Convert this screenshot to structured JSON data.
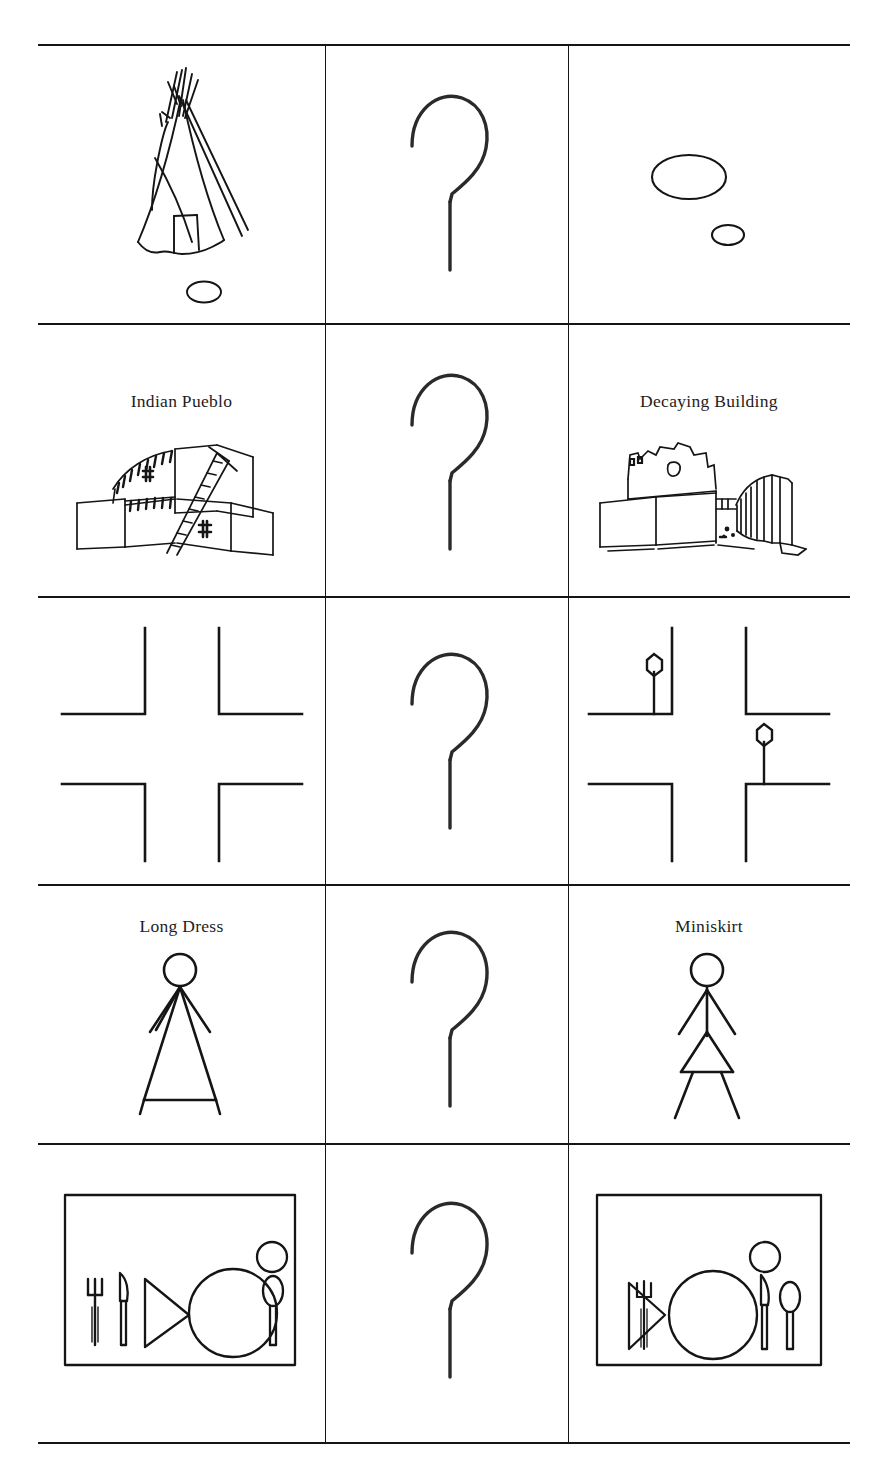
{
  "figure": {
    "type": "pictorial-comparison-grid",
    "background_color": "#ffffff",
    "ink_color": "#151515",
    "columns": 3,
    "rows": 5,
    "middle_column_content": "hand-drawn question mark (no dot)",
    "rules": {
      "horizontal_y": [
        44,
        323,
        596,
        884,
        1143,
        1442
      ],
      "vertical_x": [
        325,
        568
      ],
      "left_x": 38,
      "right_x": 850
    }
  },
  "rows": [
    {
      "id": "row-teepee",
      "left": {
        "label": "",
        "art_name": "teepee-drawing",
        "description": "teepee with small oval below"
      },
      "middle": {
        "label": "",
        "art_name": "question-mark-icon"
      },
      "right": {
        "label": "",
        "art_name": "two-ovals-drawing",
        "description": "large ellipse with small ellipse below right"
      }
    },
    {
      "id": "row-pueblo",
      "left": {
        "label": "Indian Pueblo",
        "art_name": "pueblo-building-drawing",
        "description": "adobe pueblo with ladder"
      },
      "middle": {
        "label": "",
        "art_name": "question-mark-icon"
      },
      "right": {
        "label": "Decaying Building",
        "art_name": "decaying-building-drawing",
        "description": "crumbling adobe structure with ribbed section"
      }
    },
    {
      "id": "row-intersection",
      "left": {
        "label": "",
        "art_name": "intersection-drawing",
        "description": "four-way street intersection, four L corners"
      },
      "middle": {
        "label": "",
        "art_name": "question-mark-icon"
      },
      "right": {
        "label": "",
        "art_name": "intersection-with-stop-signs-drawing",
        "description": "same intersection with two hexagonal stop signs on posts"
      }
    },
    {
      "id": "row-dress",
      "left": {
        "label": "Long Dress",
        "art_name": "long-dress-figure",
        "description": "stick figure with full-length triangular dress"
      },
      "middle": {
        "label": "",
        "art_name": "question-mark-icon"
      },
      "right": {
        "label": "Miniskirt",
        "art_name": "miniskirt-figure",
        "description": "stick figure with short triangular skirt and visible legs"
      }
    },
    {
      "id": "row-place-setting",
      "left": {
        "label": "",
        "art_name": "place-setting-formal",
        "description": "placemat with fork, knife, napkin triangle, plate, glass, spoon"
      },
      "middle": {
        "label": "",
        "art_name": "question-mark-icon"
      },
      "right": {
        "label": "",
        "art_name": "place-setting-casual",
        "description": "placemat with napkin and fork at left, plate, glass, knife and spoon at right"
      }
    }
  ]
}
